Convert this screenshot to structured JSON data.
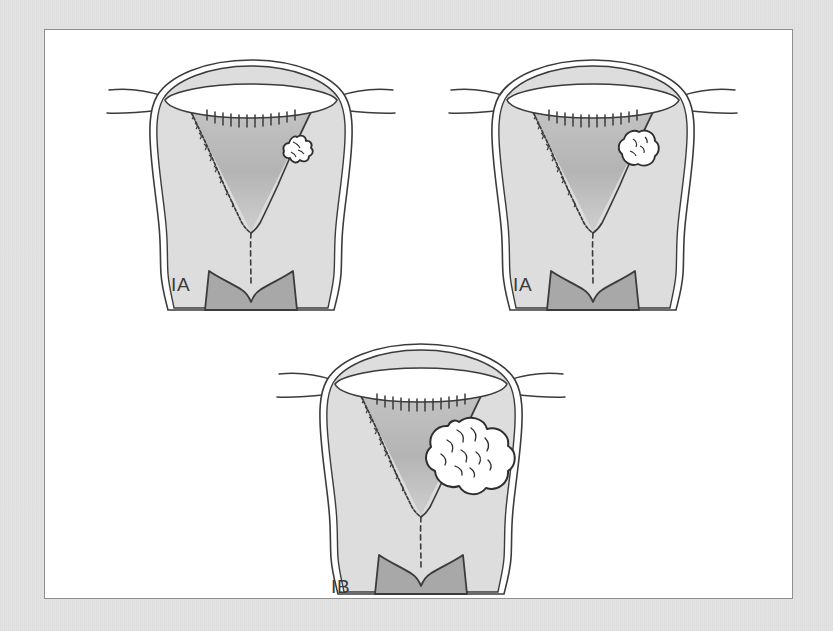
{
  "figure": {
    "type": "medical-illustration",
    "background_color": "#e3e3e3",
    "plate_color": "#ffffff",
    "plate_border_color": "#8e8e8e"
  },
  "palette": {
    "outline": "#3b3b3b",
    "serosa_fill": "#ffffff",
    "myometrium_fill": "#dddddd",
    "endometrial_cavity_fill": "#b6b6b6",
    "cervix_fill": "#a8a8a8",
    "tumor_fill": "#ffffff",
    "tumor_outline": "#2e2e2e",
    "label_color": "#3a3a3a"
  },
  "panels": [
    {
      "id": "panel-top-left",
      "stage_label": "IA",
      "label_x": 70,
      "label_y": 240,
      "tumor": {
        "kind": "nodular-flat-lesion",
        "description": "small beaded lesion confined to endometrium, right lateral cavity wall",
        "size": "small",
        "invasion": "none"
      }
    },
    {
      "id": "panel-top-right",
      "stage_label": "IA",
      "label_x": 70,
      "label_y": 240,
      "tumor": {
        "kind": "oval-nodule",
        "description": "rounded polypoid nodule on right endometrial surface, less than half myometrium",
        "size": "small",
        "invasion": "less-than-one-half-myometrium"
      }
    },
    {
      "id": "panel-bottom-center",
      "stage_label": "IB",
      "label_x": 60,
      "label_y": 258,
      "tumor": {
        "kind": "lobulated-mass",
        "description": "large cauliflower mass invading outer half of myometrium",
        "size": "large",
        "invasion": "one-half-or-more-myometrium"
      }
    }
  ]
}
